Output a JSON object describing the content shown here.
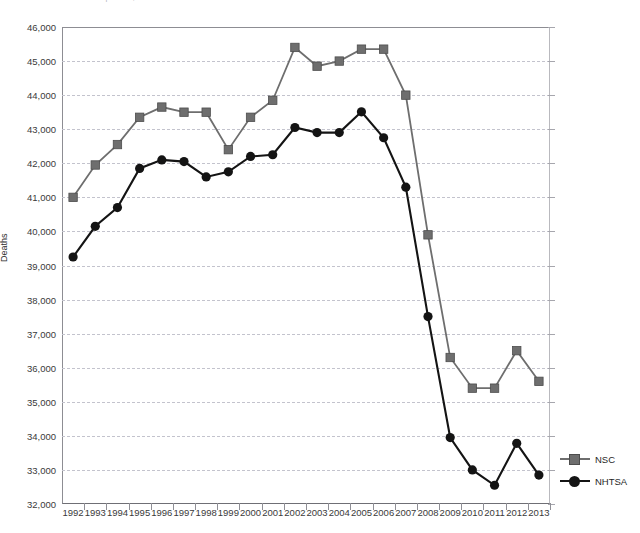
{
  "chart_title_fragment": "Motor Vehicle Deaths Comparison, NSC vs NHTSA",
  "legend": {
    "position": "right-bottom",
    "entries": [
      {
        "label": "NSC",
        "color": "#6e6e6e",
        "marker": "square"
      },
      {
        "label": "NHTSA",
        "color": "#141414",
        "marker": "circle"
      }
    ]
  },
  "axis": {
    "y_title": "Deaths",
    "y_ticks": [
      "46,000",
      "45,000",
      "44,000",
      "43,000",
      "42,000",
      "41,000",
      "40,000",
      "39,000",
      "38,000",
      "37,000",
      "36,000",
      "35,000",
      "34,000",
      "33,000",
      "32,000"
    ],
    "x_ticks": [
      "1992",
      "1993",
      "1994",
      "1995",
      "1996",
      "1997",
      "1998",
      "1999",
      "2000",
      "2001",
      "2002",
      "2003",
      "2004",
      "2005",
      "2006",
      "2007",
      "2008",
      "2009",
      "2010",
      "2011",
      "2012",
      "2013"
    ]
  },
  "chart_data": {
    "type": "line",
    "title": "Motor Vehicle Deaths Comparison, NSC vs NHTSA",
    "xlabel": "",
    "ylabel": "Deaths",
    "ylim": [
      32000,
      46000
    ],
    "ytick_step": 1000,
    "grid": true,
    "legend_position": "right",
    "x": [
      "1992",
      "1993",
      "1994",
      "1995",
      "1996",
      "1997",
      "1998",
      "1999",
      "2000",
      "2001",
      "2002",
      "2003",
      "2004",
      "2005",
      "2006",
      "2007",
      "2008",
      "2009",
      "2010",
      "2011",
      "2012",
      "2013"
    ],
    "series": [
      {
        "name": "NSC",
        "color": "#6e6e6e",
        "marker": "square",
        "values": [
          41000,
          41950,
          42550,
          43350,
          43650,
          43500,
          43500,
          42400,
          43350,
          43850,
          45400,
          44850,
          45000,
          45350,
          45350,
          44000,
          39900,
          36300,
          35400,
          35400,
          36500,
          35600
        ]
      },
      {
        "name": "NHTSA",
        "color": "#141414",
        "marker": "circle",
        "values": [
          39250,
          40150,
          40700,
          41850,
          42100,
          42050,
          41600,
          41750,
          42200,
          42250,
          43050,
          42900,
          42900,
          43510,
          42750,
          41300,
          37500,
          33950,
          33000,
          32550,
          33780,
          32850
        ]
      }
    ]
  }
}
